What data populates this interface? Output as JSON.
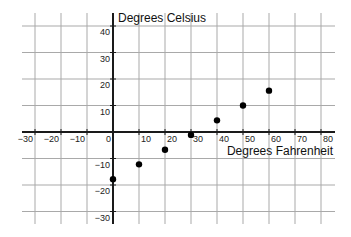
{
  "chart_data": {
    "type": "scatter",
    "title": "",
    "xlabel": "Degrees Fahrenheit",
    "ylabel": "Degrees Celsius",
    "xlim": [
      -33,
      83
    ],
    "ylim": [
      -35,
      45
    ],
    "x_ticks": [
      -30,
      -20,
      -10,
      0,
      10,
      20,
      30,
      40,
      50,
      60,
      70,
      80
    ],
    "y_ticks": [
      40,
      30,
      20,
      10,
      -10,
      -20,
      -30
    ],
    "grid": true,
    "legend": null,
    "series": [
      {
        "name": "Fahrenheit to Celsius",
        "points": [
          {
            "x": 0,
            "y": -17.8
          },
          {
            "x": 10,
            "y": -12.2
          },
          {
            "x": 20,
            "y": -6.7
          },
          {
            "x": 30,
            "y": -1.1
          },
          {
            "x": 40,
            "y": 4.4
          },
          {
            "x": 50,
            "y": 10
          },
          {
            "x": 60,
            "y": 15.6
          }
        ]
      }
    ]
  },
  "layout": {
    "origin_px": [
      113,
      132
    ],
    "x_px_per_unit": 2.6,
    "y_px_per_unit": 2.65,
    "grid_x_px": [
      22,
      335
    ],
    "grid_y_px": [
      13,
      224
    ]
  }
}
